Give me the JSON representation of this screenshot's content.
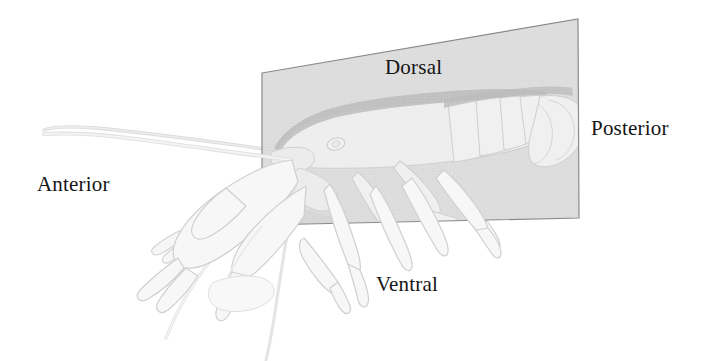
{
  "figure": {
    "background_color": "#ffffff",
    "plane": {
      "name": "sagittal-plane",
      "fill_color": "#d9d9d9",
      "edge_color": "#8a8a8a",
      "opacity": 0.62,
      "corners": [
        {
          "x": 262,
          "y": 73
        },
        {
          "x": 578,
          "y": 19
        },
        {
          "x": 579,
          "y": 218
        },
        {
          "x": 262,
          "y": 225
        }
      ]
    },
    "animal": {
      "outline_color": "#c9c9c9",
      "fill_color": "#f2f2f2",
      "dorsal_shade_color": "#b4b4b4"
    },
    "labels": [
      {
        "id": "dorsal",
        "text": "Dorsal",
        "position": "top",
        "x": 385,
        "y": 57,
        "color": "#151515"
      },
      {
        "id": "ventral",
        "text": "Ventral",
        "position": "bottom",
        "x": 376,
        "y": 274,
        "color": "#151515"
      },
      {
        "id": "anterior",
        "text": "Anterior",
        "position": "left",
        "x": 37,
        "y": 174,
        "color": "#151515"
      },
      {
        "id": "posterior",
        "text": "Posterior",
        "position": "right",
        "x": 591,
        "y": 118,
        "color": "#151515"
      }
    ]
  }
}
